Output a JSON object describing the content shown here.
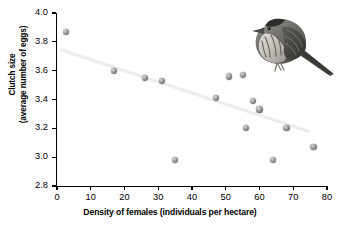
{
  "chart_data": {
    "type": "scatter",
    "title": "",
    "xlabel": "Density of females (individuals per hectare)",
    "ylabel": "Clutch size\n(average number of eggs)",
    "ylabel_line1": "Clutch size",
    "ylabel_line2": "(average number of eggs)",
    "xlim": [
      0,
      80
    ],
    "ylim": [
      2.8,
      4.0
    ],
    "xticks": [
      0,
      10,
      20,
      30,
      40,
      50,
      60,
      70,
      80
    ],
    "yticks": [
      "2.8",
      "3.0",
      "3.2",
      "3.4",
      "3.6",
      "3.8",
      "4.0"
    ],
    "grid": false,
    "legend": "none",
    "marker_color": "#7a7a7a",
    "trendline_color": "#ededed",
    "axis_color": "#000000",
    "points": [
      {
        "x": 2.7,
        "y": 3.87
      },
      {
        "x": 17.0,
        "y": 3.6
      },
      {
        "x": 26.0,
        "y": 3.55
      },
      {
        "x": 31.0,
        "y": 3.53
      },
      {
        "x": 35.0,
        "y": 2.98
      },
      {
        "x": 47.0,
        "y": 3.41
      },
      {
        "x": 51.0,
        "y": 3.56
      },
      {
        "x": 55.0,
        "y": 3.57
      },
      {
        "x": 56.0,
        "y": 3.2
      },
      {
        "x": 58.0,
        "y": 3.39
      },
      {
        "x": 60.0,
        "y": 3.33
      },
      {
        "x": 64.0,
        "y": 2.98
      },
      {
        "x": 68.0,
        "y": 3.2
      },
      {
        "x": 76.0,
        "y": 3.07
      }
    ],
    "trendline": {
      "x0": 1.0,
      "y0": 3.745,
      "x1": 75.0,
      "y1": 3.175
    }
  },
  "figure": {
    "illustration_name": "sparrow-bird-illustration"
  }
}
